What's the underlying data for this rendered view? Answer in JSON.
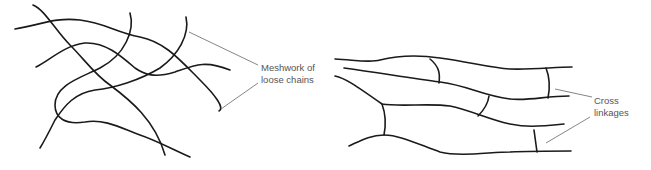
{
  "diagram": {
    "left_panel": {
      "label_line1": "Meshwork of",
      "label_line2": "loose chains"
    },
    "right_panel": {
      "label_line1": "Cross",
      "label_line2": "linkages"
    },
    "colors": {
      "line": "#1a1a1a",
      "leader": "#777777",
      "label": "#555555",
      "background": "#ffffff"
    }
  }
}
